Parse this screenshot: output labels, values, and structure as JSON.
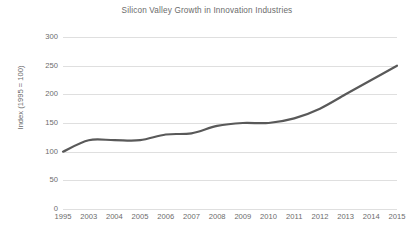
{
  "chart_data": {
    "type": "line",
    "title": "Silicon Valley Growth in Innovation Industries",
    "xlabel": "",
    "ylabel": "Index (1995 = 100)",
    "categories": [
      "1995",
      "2003",
      "2004",
      "2005",
      "2006",
      "2007",
      "2008",
      "2009",
      "2010",
      "2011",
      "2012",
      "2013",
      "2014",
      "2015"
    ],
    "values": [
      100,
      120,
      120,
      120,
      130,
      132,
      145,
      150,
      150,
      158,
      175,
      200,
      225,
      250
    ],
    "series": [
      {
        "name": "Index (1995 = 100)",
        "values": [
          100,
          120,
          120,
          120,
          130,
          132,
          145,
          150,
          150,
          158,
          175,
          200,
          225,
          250
        ],
        "color": "#595959"
      }
    ],
    "ylim": [
      0,
      300
    ],
    "yticks": [
      0,
      50,
      100,
      150,
      200,
      250,
      300
    ],
    "ytick_labels": [
      "0",
      "50",
      "100",
      "150",
      "200",
      "250",
      "300"
    ],
    "grid": "horizontal",
    "legend": "none",
    "smooth": true,
    "line_width": 2.2,
    "colors": {
      "line": "#595959",
      "gridline": "#dfdfdf",
      "text": "#6b6b6b",
      "background": "#ffffff"
    }
  }
}
